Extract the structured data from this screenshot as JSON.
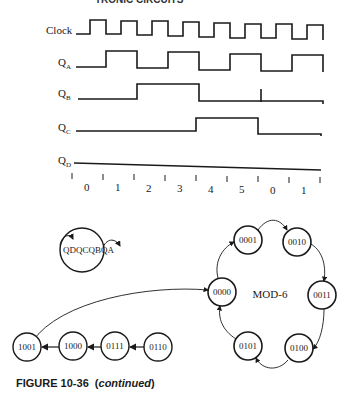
{
  "header": {
    "text": "TRONIC CIRCUITS"
  },
  "timing_diagram": {
    "signals": [
      {
        "name": "Clock",
        "label": "Clock",
        "subscript": ""
      },
      {
        "name": "QA",
        "label": "Q",
        "subscript": "A"
      },
      {
        "name": "QB",
        "label": "Q",
        "subscript": "B"
      },
      {
        "name": "QC",
        "label": "Q",
        "subscript": "C"
      },
      {
        "name": "QD",
        "label": "Q",
        "subscript": "D"
      }
    ],
    "count_labels": [
      "0",
      "1",
      "2",
      "3",
      "4",
      "5",
      "0",
      "1"
    ]
  },
  "state_legend": {
    "text": "QDQCQBQA"
  },
  "state_diagram": {
    "center_label": "MOD-6",
    "cycle_states": [
      "0000",
      "0001",
      "0010",
      "0011",
      "0100",
      "0101"
    ],
    "transient_states": [
      "1001",
      "1000",
      "0111",
      "0110"
    ]
  },
  "caption": {
    "figure": "FIGURE 10-36",
    "note": "continued"
  }
}
